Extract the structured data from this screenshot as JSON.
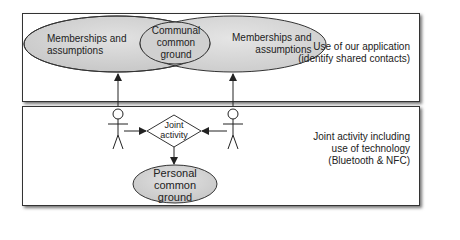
{
  "top_panel": {
    "left_ellipse": {
      "line1": "Memberships and",
      "line2": "assumptions"
    },
    "overlap_ellipse": {
      "line1": "Communal",
      "line2": "common",
      "line3": "ground"
    },
    "right_ellipse": {
      "line1": "Memberships and",
      "line2": "assumptions"
    },
    "caption": {
      "line1": "Use of our application",
      "line2": "(identify shared contacts)"
    }
  },
  "bottom_panel": {
    "diamond": {
      "line1": "Joint",
      "line2": "activity"
    },
    "personal_ellipse": {
      "line1": "Personal",
      "line2": "common",
      "line3": "ground"
    },
    "caption": {
      "line1": "Joint activity including",
      "line2": "use of technology",
      "line3": "(Bluetooth  & NFC)"
    }
  },
  "colors": {
    "ellipse_fill": "#d4d4d4",
    "stroke": "#222222",
    "panel_border": "#333333"
  }
}
